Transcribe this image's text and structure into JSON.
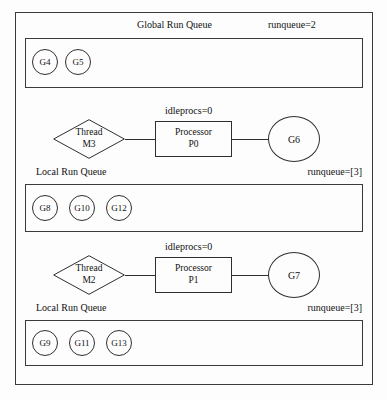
{
  "diagram": {
    "title_global": "Global Run Queue",
    "global_runqueue": "runqueue=2",
    "global_queue_items": [
      "G4",
      "G5"
    ],
    "schedulers": [
      {
        "idleprocs": "idleprocs=0",
        "thread_line1": "Thread",
        "thread_line2": "M3",
        "processor_line1": "Processor",
        "processor_line2": "P0",
        "goroutine": "G6",
        "local_queue_title": "Local Run Queue",
        "local_runqueue": "runqueue=[3]",
        "local_queue_items": [
          "G8",
          "G10",
          "G12"
        ]
      },
      {
        "idleprocs": "idleprocs=0",
        "thread_line1": "Thread",
        "thread_line2": "M2",
        "processor_line1": "Processor",
        "processor_line2": "P1",
        "goroutine": "G7",
        "local_queue_title": "Local Run Queue",
        "local_runqueue": "runqueue=[3]",
        "local_queue_items": [
          "G9",
          "G11",
          "G13"
        ]
      }
    ],
    "colors": {
      "stroke": "#2f2f2f",
      "frame_stroke": "#3a3a3a",
      "background": "#fdfdfd",
      "text": "#111111"
    }
  }
}
